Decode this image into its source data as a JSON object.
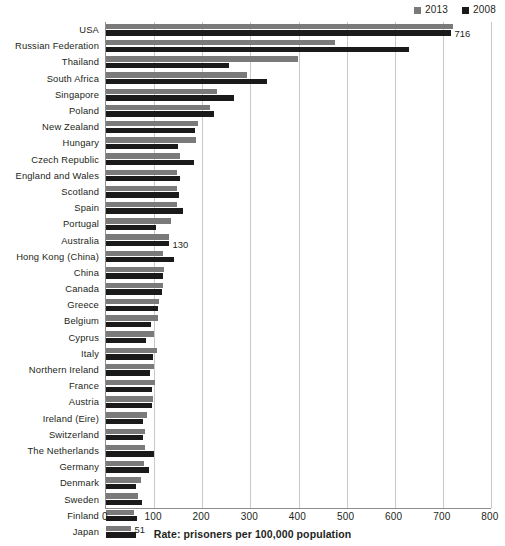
{
  "legend": {
    "position": "top-right",
    "entries": [
      {
        "label": "2013",
        "color": "#7a7a7a"
      },
      {
        "label": "2008",
        "color": "#1a1a1a"
      }
    ]
  },
  "axis": {
    "xlabel": "Rate: prisoners per 100,000 population",
    "ticks": [
      "0",
      "100",
      "200",
      "300",
      "400",
      "500",
      "600",
      "700",
      "800"
    ]
  },
  "chart_data": {
    "type": "bar",
    "orientation": "horizontal",
    "title": "",
    "subtitle": "",
    "xlabel": "Rate: prisoners per 100,000 population",
    "ylabel": "",
    "xlim": [
      0,
      800
    ],
    "xticks": [
      0,
      100,
      200,
      300,
      400,
      500,
      600,
      700,
      800
    ],
    "grid": "vertical",
    "legend_position": "top-right",
    "categories": [
      "USA",
      "Russian Federation",
      "Thailand",
      "South Africa",
      "Singapore",
      "Poland",
      "New Zealand",
      "Hungary",
      "Czech Republic",
      "England and Wales",
      "Scotland",
      "Spain",
      "Portugal",
      "Australia",
      "Hong Kong (China)",
      "China",
      "Canada",
      "Greece",
      "Belgium",
      "Cyprus",
      "Italy",
      "Northern Ireland",
      "France",
      "Austria",
      "Ireland (Eire)",
      "Switzerland",
      "The Netherlands",
      "Germany",
      "Denmark",
      "Sweden",
      "Finland",
      "Japan"
    ],
    "series": [
      {
        "name": "2013",
        "color": "#7a7a7a",
        "values": [
          720,
          475,
          398,
          294,
          230,
          217,
          192,
          186,
          154,
          148,
          147,
          147,
          136,
          130,
          118,
          121,
          118,
          111,
          108,
          100,
          106,
          100,
          101,
          98,
          86,
          82,
          82,
          79,
          73,
          67,
          58,
          51
        ]
      },
      {
        "name": "2008",
        "color": "#1a1a1a",
        "values": [
          716,
          629,
          256,
          334,
          267,
          224,
          185,
          149,
          182,
          153,
          152,
          160,
          104,
          130,
          142,
          119,
          116,
          109,
          93,
          83,
          97,
          92,
          96,
          95,
          76,
          76,
          100,
          89,
          63,
          74,
          64,
          63
        ]
      }
    ],
    "data_labels": [
      {
        "category": "USA",
        "series": "2008",
        "value": 716,
        "text": "716"
      },
      {
        "category": "Australia",
        "series": "2008",
        "value": 130,
        "text": "130"
      },
      {
        "category": "Japan",
        "series": "2013",
        "value": 51,
        "text": "51"
      }
    ]
  }
}
